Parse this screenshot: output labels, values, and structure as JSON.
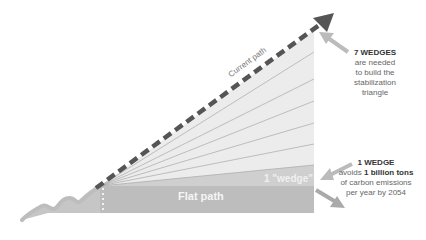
{
  "diagram": {
    "title": "Stabilization triangle",
    "labels": {
      "current_path": "Current path",
      "flat_path": "Flat path",
      "one_wedge": "1 \"wedge\""
    },
    "callout_seven": {
      "heading": "7 WEDGES",
      "line1": "are needed",
      "line2": "to build the",
      "line3": "stabilization",
      "line4": "triangle"
    },
    "callout_one": {
      "heading": "1 WEDGE",
      "pre": "avoids ",
      "bold": "1 billion tons",
      "line2": "of carbon emissions",
      "line3": "per year by 2054"
    },
    "colors": {
      "triangle_fill": "#ececec",
      "wedge_fill": "#cfcfcf",
      "flat_fill": "#bdbdbd",
      "dashed_arrow": "#555555",
      "callout_arrow": "#bbbbbb",
      "fan_lines": "#a8a8a8"
    },
    "wedge_count": 7
  }
}
